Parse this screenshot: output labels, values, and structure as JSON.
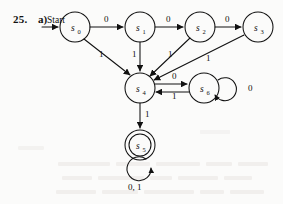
{
  "exercise": {
    "number": "25.",
    "part": "a)",
    "start_label": "Start"
  },
  "figure": {
    "type": "finite-state-machine",
    "alphabet": [
      "0",
      "1"
    ],
    "start_state": "s0",
    "accepting_states": [
      "s5"
    ],
    "states": [
      {
        "id": "s0",
        "label": "s",
        "sub": "0",
        "cx": 75,
        "cy": 27,
        "r": 15,
        "accepting": false
      },
      {
        "id": "s1",
        "label": "s",
        "sub": "1",
        "cx": 140,
        "cy": 27,
        "r": 15,
        "accepting": false
      },
      {
        "id": "s2",
        "label": "s",
        "sub": "2",
        "cx": 200,
        "cy": 27,
        "r": 15,
        "accepting": false
      },
      {
        "id": "s3",
        "label": "s",
        "sub": "3",
        "cx": 258,
        "cy": 27,
        "r": 15,
        "accepting": false
      },
      {
        "id": "s4",
        "label": "s",
        "sub": "4",
        "cx": 140,
        "cy": 88,
        "r": 15,
        "accepting": false
      },
      {
        "id": "s6",
        "label": "s",
        "sub": "6",
        "cx": 204,
        "cy": 88,
        "r": 15,
        "accepting": false
      },
      {
        "id": "s5",
        "label": "s",
        "sub": "5",
        "cx": 140,
        "cy": 145,
        "r": 15,
        "accepting": true
      }
    ],
    "transitions": [
      {
        "from": "s0",
        "to": "s1",
        "input": "0",
        "lx": 107,
        "ly": 22
      },
      {
        "from": "s1",
        "to": "s2",
        "input": "0",
        "lx": 170,
        "ly": 22
      },
      {
        "from": "s2",
        "to": "s3",
        "input": "0",
        "lx": 229,
        "ly": 22
      },
      {
        "from": "s0",
        "to": "s4",
        "input": "1",
        "lx": 101,
        "ly": 54
      },
      {
        "from": "s1",
        "to": "s4",
        "input": "1",
        "lx": 134,
        "ly": 54
      },
      {
        "from": "s2",
        "to": "s4",
        "input": "1",
        "lx": 170,
        "ly": 54
      },
      {
        "from": "s3",
        "to": "s4",
        "input": "1",
        "lx": 208,
        "ly": 58
      },
      {
        "from": "s4",
        "to": "s6",
        "input": "0",
        "lx": 175,
        "ly": 74
      },
      {
        "from": "s6",
        "to": "s4",
        "input": "1",
        "lx": 175,
        "ly": 95
      },
      {
        "from": "s6",
        "to": "s6",
        "input": "0",
        "lx": 253,
        "ly": 85
      },
      {
        "from": "s4",
        "to": "s5",
        "input": "1",
        "lx": 147,
        "ly": 112
      },
      {
        "from": "s5",
        "to": "s5",
        "input": "0, 1",
        "lx": 130,
        "ly": 183
      }
    ]
  },
  "colors": {
    "ink": "#111111",
    "paper": "#fbfbfa",
    "bleed": "#eeecea"
  }
}
